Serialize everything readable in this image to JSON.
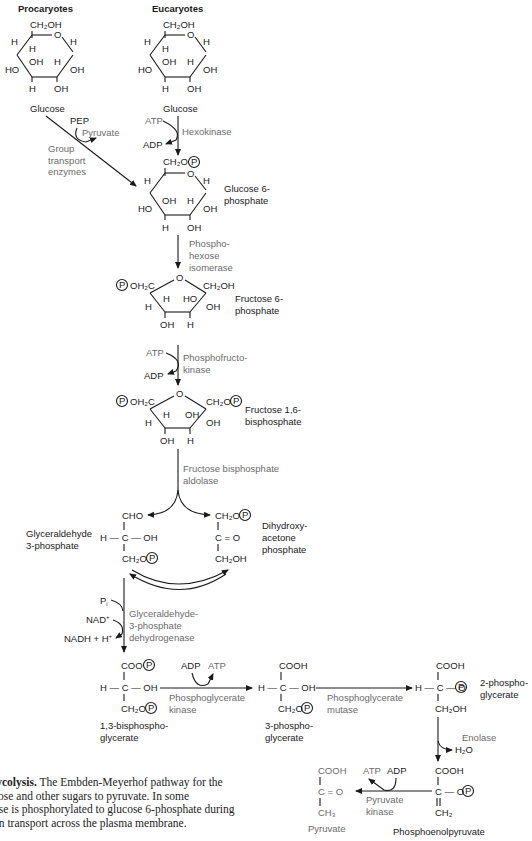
{
  "headers": {
    "procaryotes": "Procaryotes",
    "eucaryotes": "Eucaryotes"
  },
  "compounds": {
    "glucose": "Glucose",
    "glucose6p": [
      "Glucose 6-",
      "phosphate"
    ],
    "fructose6p": [
      "Fructose 6-",
      "phosphate"
    ],
    "fructose16bp": [
      "Fructose 1,6-",
      "bisphosphate"
    ],
    "gap": [
      "Glyceraldehyde",
      "3-phosphate"
    ],
    "dhap": [
      "Dihydroxy-",
      "acetone",
      "phosphate"
    ],
    "bpg13": [
      "1,3-bisphospho-",
      "glycerate"
    ],
    "pg3": [
      "3-phospho-",
      "glycerate"
    ],
    "pg2": [
      "2-phospho-",
      "glycerate"
    ],
    "pep": "Phosphoenolpyruvate",
    "pyruvate": "Pyruvate"
  },
  "enzymes": {
    "hexokinase": "Hexokinase",
    "group_transport": [
      "Group",
      "transport",
      "enzymes"
    ],
    "phosphohexose_isomerase": [
      "Phospho-",
      "hexose",
      "isomerase"
    ],
    "phosphofructokinase": [
      "Phosphofructo-",
      "kinase"
    ],
    "aldolase": [
      "Fructose bisphosphate",
      "aldolase"
    ],
    "gapdh": [
      "Glyceraldehyde-",
      "3-phosphate",
      "dehydrogenase"
    ],
    "pgk": [
      "Phosphoglycerate",
      "kinase"
    ],
    "pgm": [
      "Phosphoglycerate",
      "mutase"
    ],
    "enolase": "Enolase",
    "pyruvate_kinase": [
      "Pyruvate",
      "kinase"
    ]
  },
  "cofactors": {
    "atp": "ATP",
    "adp": "ADP",
    "pep": "PEP",
    "pyruvate": "Pyruvate",
    "pi": "P",
    "pi_sub": "i",
    "nad": "NAD",
    "nadh": "NADH + H",
    "h2o": "H₂O"
  },
  "atoms": {
    "ch2oh": "CH₂OH",
    "ch2o": "CH₂O",
    "oh2c": "OH₂C",
    "h": "H",
    "oh": "OH",
    "ho": "HO",
    "o": "O",
    "cho": "CHO",
    "cooh": "COOH",
    "coo": "COO",
    "c": "C",
    "co": "C = O",
    "ch3": "CH₃",
    "ch2": "CH₂",
    "hcoh": "H — C — OH",
    "hco": "H — C — O",
    "phosphate_circle": "P"
  },
  "caption": {
    "bold": "lycolysis.",
    "lines": [
      " The Embden-Meyerhof pathway for the",
      "cose and other sugars to pyruvate. In some",
      "ose is phosphorylated to glucose 6-phosphate during",
      "on transport across the plasma membrane."
    ]
  },
  "colors": {
    "text": "#1a1a1a",
    "enzyme_text": "#6b6b6b",
    "background": "#ffffff"
  }
}
